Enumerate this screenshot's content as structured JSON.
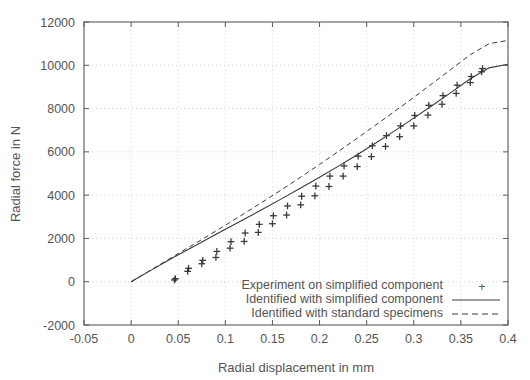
{
  "chart_data": {
    "type": "scatter",
    "title": "",
    "xlabel": "Radial displacement in mm",
    "ylabel": "Radial force in N",
    "xlim": [
      -0.05,
      0.4
    ],
    "ylim": [
      -2000,
      12000
    ],
    "xticks": [
      "-0.05",
      "0",
      "0.05",
      "0.1",
      "0.15",
      "0.2",
      "0.25",
      "0.3",
      "0.35",
      "0.4"
    ],
    "xtick_values": [
      -0.05,
      0,
      0.05,
      0.1,
      0.15,
      0.2,
      0.25,
      0.3,
      0.35,
      0.4
    ],
    "yticks": [
      "-2000",
      "0",
      "2000",
      "4000",
      "6000",
      "8000",
      "10000",
      "12000"
    ],
    "ytick_values": [
      -2000,
      0,
      2000,
      4000,
      6000,
      8000,
      10000,
      12000
    ],
    "grid": true,
    "legend_position": "bottom-right",
    "series": [
      {
        "name": "Experiment on simplified component",
        "style": "points",
        "marker": "+",
        "color": "#3a3a3a",
        "points": [
          [
            0.046,
            80
          ],
          [
            0.047,
            140
          ],
          [
            0.06,
            480
          ],
          [
            0.061,
            620
          ],
          [
            0.075,
            830
          ],
          [
            0.076,
            990
          ],
          [
            0.09,
            1120
          ],
          [
            0.091,
            1400
          ],
          [
            0.105,
            1550
          ],
          [
            0.106,
            1850
          ],
          [
            0.12,
            1860
          ],
          [
            0.121,
            2250
          ],
          [
            0.135,
            2280
          ],
          [
            0.136,
            2650
          ],
          [
            0.15,
            2680
          ],
          [
            0.151,
            3050
          ],
          [
            0.165,
            3080
          ],
          [
            0.166,
            3500
          ],
          [
            0.18,
            3550
          ],
          [
            0.181,
            3950
          ],
          [
            0.195,
            3970
          ],
          [
            0.196,
            4420
          ],
          [
            0.21,
            4400
          ],
          [
            0.211,
            4880
          ],
          [
            0.225,
            4880
          ],
          [
            0.226,
            5350
          ],
          [
            0.24,
            5320
          ],
          [
            0.241,
            5800
          ],
          [
            0.255,
            5780
          ],
          [
            0.256,
            6280
          ],
          [
            0.27,
            6250
          ],
          [
            0.271,
            6750
          ],
          [
            0.285,
            6700
          ],
          [
            0.286,
            7200
          ],
          [
            0.3,
            7200
          ],
          [
            0.301,
            7680
          ],
          [
            0.315,
            7700
          ],
          [
            0.316,
            8150
          ],
          [
            0.33,
            8200
          ],
          [
            0.331,
            8600
          ],
          [
            0.345,
            8700
          ],
          [
            0.346,
            9080
          ],
          [
            0.36,
            9200
          ],
          [
            0.361,
            9480
          ],
          [
            0.372,
            9700
          ],
          [
            0.373,
            9850
          ]
        ]
      },
      {
        "name": "Identified with simplified component",
        "style": "solid-line",
        "color": "#3a3a3a",
        "points": [
          [
            0.0,
            0
          ],
          [
            0.02,
            500
          ],
          [
            0.04,
            1000
          ],
          [
            0.06,
            1480
          ],
          [
            0.08,
            1950
          ],
          [
            0.1,
            2420
          ],
          [
            0.12,
            2890
          ],
          [
            0.14,
            3360
          ],
          [
            0.16,
            3840
          ],
          [
            0.18,
            4330
          ],
          [
            0.2,
            4830
          ],
          [
            0.22,
            5340
          ],
          [
            0.24,
            5870
          ],
          [
            0.26,
            6420
          ],
          [
            0.28,
            6980
          ],
          [
            0.3,
            7560
          ],
          [
            0.32,
            8150
          ],
          [
            0.34,
            8760
          ],
          [
            0.36,
            9380
          ],
          [
            0.38,
            9880
          ],
          [
            0.4,
            10050
          ]
        ]
      },
      {
        "name": "Identified with standard specimens",
        "style": "dashed-line",
        "color": "#3a3a3a",
        "points": [
          [
            0.0,
            0
          ],
          [
            0.02,
            520
          ],
          [
            0.04,
            1040
          ],
          [
            0.06,
            1560
          ],
          [
            0.08,
            2080
          ],
          [
            0.1,
            2610
          ],
          [
            0.12,
            3150
          ],
          [
            0.14,
            3700
          ],
          [
            0.16,
            4260
          ],
          [
            0.18,
            4830
          ],
          [
            0.2,
            5420
          ],
          [
            0.22,
            6020
          ],
          [
            0.24,
            6630
          ],
          [
            0.26,
            7250
          ],
          [
            0.28,
            7880
          ],
          [
            0.3,
            8520
          ],
          [
            0.32,
            9170
          ],
          [
            0.34,
            9830
          ],
          [
            0.36,
            10490
          ],
          [
            0.38,
            11000
          ],
          [
            0.4,
            11150
          ]
        ]
      }
    ]
  },
  "legend": {
    "items": [
      {
        "label": "Experiment on simplified component",
        "symbol": "+"
      },
      {
        "label": "Identified with simplified component",
        "symbol": "solid"
      },
      {
        "label": "Identified with standard specimens",
        "symbol": "dashed"
      }
    ]
  },
  "colors": {
    "ink": "#4a4a4a",
    "grid": "#c8c8c8",
    "frame": "#5a5a5a",
    "background": "#ffffff"
  }
}
